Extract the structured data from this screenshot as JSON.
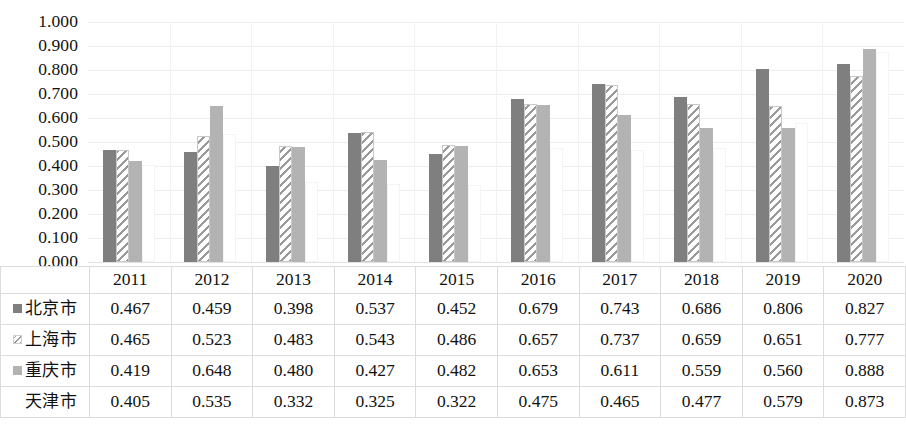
{
  "chart_data": {
    "type": "bar",
    "title": "",
    "subtitle": "",
    "xlabel": "",
    "ylabel": "",
    "categories": [
      "2011",
      "2012",
      "2013",
      "2014",
      "2015",
      "2016",
      "2017",
      "2018",
      "2019",
      "2020"
    ],
    "ylim": [
      0,
      1.0
    ],
    "ytick_step": 0.1,
    "ytick_labels": [
      "1.000",
      "0.900",
      "0.800",
      "0.700",
      "0.600",
      "0.500",
      "0.400",
      "0.300",
      "0.200",
      "0.100",
      "0.000"
    ],
    "grid": true,
    "legend_position": "data-table-row-headers",
    "series": [
      {
        "name": "北京市",
        "swatch": "solid-dark-gray",
        "color": "#7f7f7f",
        "values": [
          0.467,
          0.459,
          0.398,
          0.537,
          0.452,
          0.679,
          0.743,
          0.686,
          0.806,
          0.827
        ],
        "labels": [
          "0.467",
          "0.459",
          "0.398",
          "0.537",
          "0.452",
          "0.679",
          "0.743",
          "0.686",
          "0.806",
          "0.827"
        ]
      },
      {
        "name": "上海市",
        "swatch": "diagonal-hatch",
        "color": "#9a9a9a",
        "values": [
          0.465,
          0.523,
          0.483,
          0.543,
          0.486,
          0.657,
          0.737,
          0.659,
          0.651,
          0.777
        ],
        "labels": [
          "0.465",
          "0.523",
          "0.483",
          "0.543",
          "0.486",
          "0.657",
          "0.737",
          "0.659",
          "0.651",
          "0.777"
        ]
      },
      {
        "name": "重庆市",
        "swatch": "solid-light-gray",
        "color": "#b3b3b3",
        "values": [
          0.419,
          0.648,
          0.48,
          0.427,
          0.482,
          0.653,
          0.611,
          0.559,
          0.56,
          0.888
        ],
        "labels": [
          "0.419",
          "0.648",
          "0.480",
          "0.427",
          "0.482",
          "0.653",
          "0.611",
          "0.559",
          "0.560",
          "0.888"
        ]
      },
      {
        "name": "天津市",
        "swatch": "white",
        "color": "#ffffff",
        "values": [
          0.405,
          0.535,
          0.332,
          0.325,
          0.322,
          0.475,
          0.465,
          0.477,
          0.579,
          0.873
        ],
        "labels": [
          "0.405",
          "0.535",
          "0.332",
          "0.325",
          "0.322",
          "0.475",
          "0.465",
          "0.477",
          "0.579",
          "0.873"
        ]
      }
    ]
  },
  "table": {
    "corner_label": "",
    "column_headers": [
      "2011",
      "2012",
      "2013",
      "2014",
      "2015",
      "2016",
      "2017",
      "2018",
      "2019",
      "2020"
    ],
    "rows": [
      {
        "label": "北京市",
        "values": [
          "0.467",
          "0.459",
          "0.398",
          "0.537",
          "0.452",
          "0.679",
          "0.743",
          "0.686",
          "0.806",
          "0.827"
        ]
      },
      {
        "label": "上海市",
        "values": [
          "0.465",
          "0.523",
          "0.483",
          "0.543",
          "0.486",
          "0.657",
          "0.737",
          "0.659",
          "0.651",
          "0.777"
        ]
      },
      {
        "label": "重庆市",
        "values": [
          "0.419",
          "0.648",
          "0.480",
          "0.427",
          "0.482",
          "0.653",
          "0.611",
          "0.559",
          "0.560",
          "0.888"
        ]
      },
      {
        "label": "天津市",
        "values": [
          "0.405",
          "0.535",
          "0.332",
          "0.325",
          "0.322",
          "0.475",
          "0.465",
          "0.477",
          "0.579",
          "0.873"
        ]
      }
    ]
  },
  "caption": {
    "text": ""
  },
  "colors": {
    "series_1": "#7f7f7f",
    "series_2": "#9a9a9a",
    "series_3": "#b3b3b3",
    "series_4": "#ffffff",
    "gridline": "#ededed",
    "table_border": "#dcdcdc",
    "text": "#111111"
  }
}
